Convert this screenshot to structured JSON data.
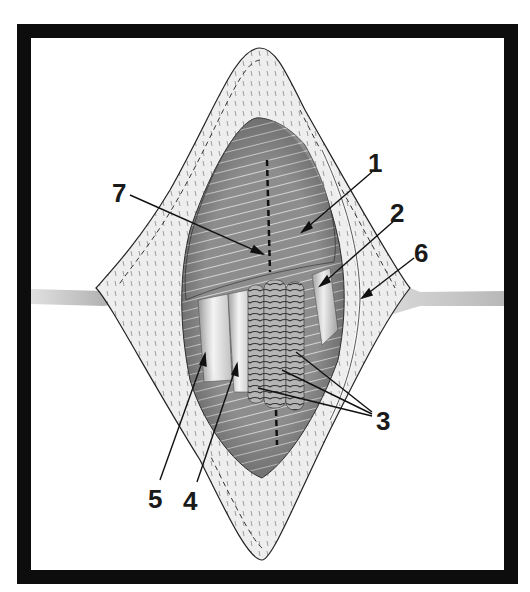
{
  "figure": {
    "type": "surgical-illustration",
    "frame_color": "#0d0d0d",
    "background": "#ffffff",
    "colors": {
      "skin": "#ececec",
      "skin_dark": "#bdbdbd",
      "muscle": "#8a8a8a",
      "muscle_dark": "#5e5e5e",
      "fascia_stripes": "#d8d8d8",
      "vessel_light": "#e6e6e6",
      "nerve_ringed": "#9a9a9a",
      "retractor": "#cfcfcf"
    },
    "labels": [
      {
        "id": "1",
        "text": "1",
        "x": 374,
        "y": 172,
        "arrow_from": [
          372,
          172
        ],
        "arrow_to": [
          302,
          232
        ]
      },
      {
        "id": "2",
        "text": "2",
        "x": 398,
        "y": 222,
        "arrow_from": [
          395,
          220
        ],
        "arrow_to": [
          320,
          286
        ]
      },
      {
        "id": "3",
        "text": "3",
        "x": 378,
        "y": 428,
        "arrow_from": [
          372,
          412
        ],
        "arrow_to": [
          [
            296,
            352
          ],
          [
            282,
            370
          ],
          [
            258,
            388
          ]
        ]
      },
      {
        "id": "4",
        "text": "4",
        "x": 184,
        "y": 508,
        "arrow_from": [
          197,
          482
        ],
        "arrow_to": [
          237,
          364
        ]
      },
      {
        "id": "5",
        "text": "5",
        "x": 148,
        "y": 506,
        "arrow_from": [
          160,
          480
        ],
        "arrow_to": [
          205,
          354
        ]
      },
      {
        "id": "6",
        "text": "6",
        "x": 416,
        "y": 260,
        "arrow_from": [
          414,
          258
        ],
        "arrow_to": [
          362,
          298
        ]
      },
      {
        "id": "7",
        "text": "7",
        "x": 113,
        "y": 200,
        "arrow_from": [
          130,
          195
        ],
        "arrow_to": [
          263,
          254
        ]
      }
    ]
  }
}
